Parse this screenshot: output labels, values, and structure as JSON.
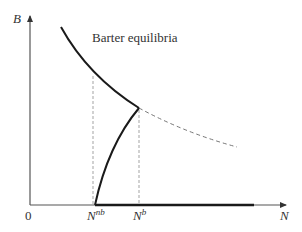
{
  "diagram": {
    "title_label": "Barter equilibria",
    "axes": {
      "y_label": "B",
      "x_label": "N",
      "origin_label": "0"
    },
    "x_ticks": [
      {
        "base": "N",
        "sup": "nb"
      },
      {
        "base": "N",
        "sup": "b"
      }
    ],
    "colors": {
      "curve": "#1a1a1a",
      "axis": "#555555",
      "dashed": "#888888"
    },
    "curves": [
      {
        "name": "barter-equilibria-curve-upper",
        "style": "solid"
      },
      {
        "name": "rising-branch",
        "style": "solid"
      },
      {
        "name": "continuation-curve",
        "style": "dashed"
      },
      {
        "name": "bottom-segment",
        "style": "solid-thick"
      }
    ]
  }
}
